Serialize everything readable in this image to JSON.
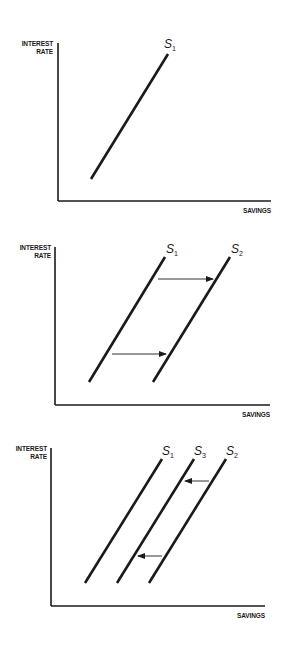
{
  "colors": {
    "ink": "#1a1a1a",
    "background": "#ffffff"
  },
  "chart_data": [
    {
      "type": "line",
      "title": "",
      "xlabel": "SAVINGS",
      "ylabel": [
        "INTEREST",
        "RATE"
      ],
      "axes": {
        "origin": [
          58,
          201
        ],
        "y_top": 43,
        "x_right": 271
      },
      "label_pos": {
        "ylabel_x": 53,
        "ylabel_y": 46,
        "xlabel_x": 271,
        "xlabel_y": 213
      },
      "series": [
        {
          "name": "S",
          "sub": "1",
          "from": [
            91,
            179
          ],
          "to": [
            168,
            54
          ],
          "label_at": [
            164,
            48
          ]
        }
      ],
      "arrows": []
    },
    {
      "type": "line",
      "title": "",
      "xlabel": "SAVINGS",
      "ylabel": [
        "INTEREST",
        "RATE"
      ],
      "axes": {
        "origin": [
          55,
          405
        ],
        "y_top": 247,
        "x_right": 270
      },
      "label_pos": {
        "ylabel_x": 51,
        "ylabel_y": 250,
        "xlabel_x": 270,
        "xlabel_y": 417
      },
      "series": [
        {
          "name": "S",
          "sub": "1",
          "from": [
            89,
            382
          ],
          "to": [
            165,
            257
          ],
          "label_at": [
            166,
            253
          ]
        },
        {
          "name": "S",
          "sub": "2",
          "from": [
            153,
            382
          ],
          "to": [
            230,
            257
          ],
          "label_at": [
            231,
            253
          ]
        }
      ],
      "arrows": [
        {
          "from": [
            158,
            279
          ],
          "to": [
            213,
            279
          ],
          "direction": "right"
        },
        {
          "from": [
            112,
            354
          ],
          "to": [
            166,
            354
          ],
          "direction": "right"
        }
      ]
    },
    {
      "type": "line",
      "title": "",
      "xlabel": "SAVINGS",
      "ylabel": [
        "INTEREST",
        "RATE"
      ],
      "axes": {
        "origin": [
          51,
          606
        ],
        "y_top": 448,
        "x_right": 265
      },
      "label_pos": {
        "ylabel_x": 47,
        "ylabel_y": 451,
        "xlabel_x": 265,
        "xlabel_y": 618
      },
      "series": [
        {
          "name": "S",
          "sub": "1",
          "from": [
            85,
            583
          ],
          "to": [
            162,
            459
          ],
          "label_at": [
            162,
            455
          ]
        },
        {
          "name": "S",
          "sub": "3",
          "from": [
            117,
            583
          ],
          "to": [
            194,
            459
          ],
          "label_at": [
            194,
            455
          ]
        },
        {
          "name": "S",
          "sub": "2",
          "from": [
            149,
            583
          ],
          "to": [
            226,
            459
          ],
          "label_at": [
            226,
            455
          ]
        }
      ],
      "arrows": [
        {
          "from": [
            209,
            481
          ],
          "to": [
            185,
            481
          ],
          "direction": "left"
        },
        {
          "from": [
            162,
            556
          ],
          "to": [
            138,
            556
          ],
          "direction": "left"
        }
      ]
    }
  ]
}
